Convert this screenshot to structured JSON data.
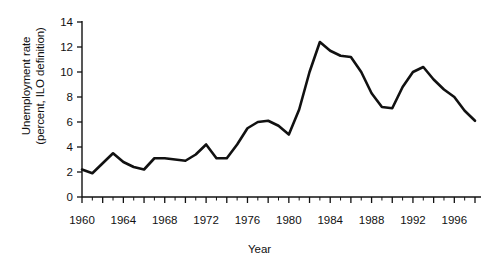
{
  "chart_data": {
    "type": "line",
    "title": "",
    "xlabel": "Year",
    "ylabel": "Unemployment rate (percent, ILO definition)",
    "ylabel_line1": "Unemployment rate",
    "ylabel_line2": "(percent, ILO definition)",
    "xlim": [
      1960,
      1998
    ],
    "ylim": [
      0,
      14
    ],
    "ytick_labels": [
      "0",
      "2",
      "4",
      "6",
      "8",
      "10",
      "12",
      "14"
    ],
    "ytick_values": [
      0,
      2,
      4,
      6,
      8,
      10,
      12,
      14
    ],
    "xtick_labels": [
      "1960",
      "1964",
      "1968",
      "1972",
      "1976",
      "1980",
      "1984",
      "1988",
      "1992",
      "1996"
    ],
    "xtick_values": [
      1960,
      1964,
      1968,
      1972,
      1976,
      1980,
      1984,
      1988,
      1992,
      1996
    ],
    "x_minor_tick_step": 1,
    "x_major_tick_step": 2,
    "grid": false,
    "legend": null,
    "legend_position": "none",
    "line_color": "#111111",
    "series": [
      {
        "name": "Unemployment rate",
        "x": [
          1960,
          1961,
          1962,
          1963,
          1964,
          1965,
          1966,
          1967,
          1968,
          1969,
          1970,
          1971,
          1972,
          1973,
          1974,
          1975,
          1976,
          1977,
          1978,
          1979,
          1980,
          1981,
          1982,
          1983,
          1984,
          1985,
          1986,
          1987,
          1988,
          1989,
          1990,
          1991,
          1992,
          1993,
          1994,
          1995,
          1996,
          1997,
          1998
        ],
        "values": [
          2.2,
          1.9,
          2.7,
          3.5,
          2.8,
          2.4,
          2.2,
          3.1,
          3.1,
          3.0,
          2.9,
          3.4,
          4.2,
          3.1,
          3.1,
          4.2,
          5.5,
          6.0,
          6.1,
          5.7,
          5.0,
          7.0,
          10.0,
          12.4,
          11.7,
          11.3,
          11.2,
          10.0,
          8.3,
          7.2,
          7.1,
          8.8,
          10.0,
          10.4,
          9.4,
          8.6,
          8.0,
          6.9,
          6.1
        ]
      }
    ]
  },
  "axes": {
    "y_title": "Unemployment rate (percent, ILO definition)",
    "x_title": "Year"
  }
}
